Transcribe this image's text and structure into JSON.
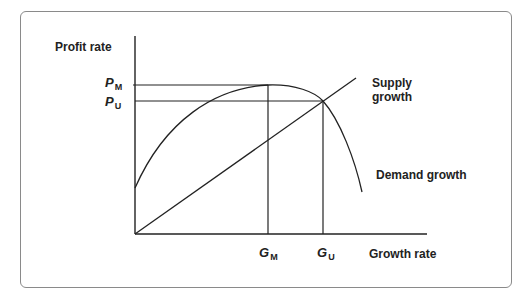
{
  "diagram": {
    "y_axis_label": "Profit rate",
    "x_axis_label": "Growth rate",
    "y_ticks": [
      {
        "main": "P",
        "sub": "M"
      },
      {
        "main": "P",
        "sub": "U"
      }
    ],
    "x_ticks": [
      {
        "main": "G",
        "sub": "M"
      },
      {
        "main": "G",
        "sub": "U"
      }
    ],
    "curves": {
      "supply": "Supply growth",
      "supply_line1": "Supply",
      "supply_line2": "growth",
      "demand": "Demand growth"
    },
    "colors": {
      "line": "#222222",
      "frame": "#8a8a8a",
      "background": "#ffffff"
    }
  }
}
